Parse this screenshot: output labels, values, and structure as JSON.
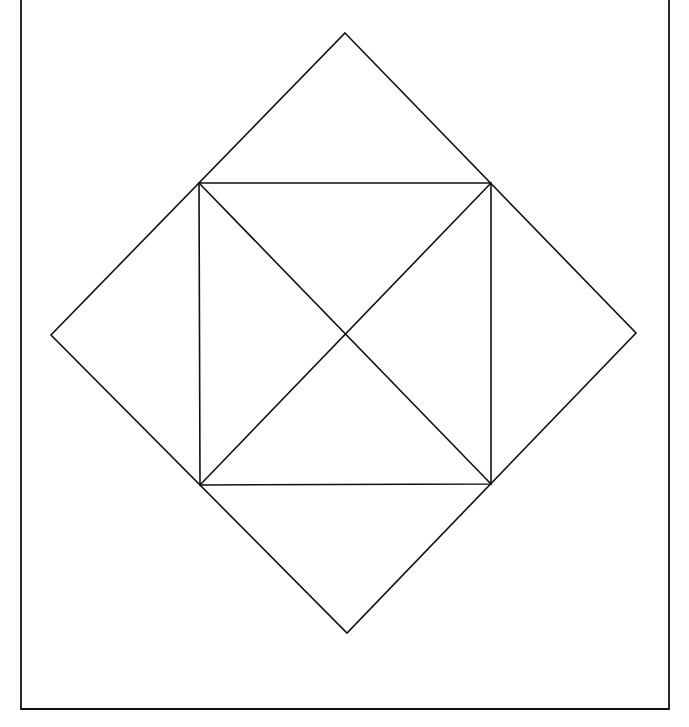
{
  "canvas": {
    "width": 689,
    "height": 727,
    "background": "#ffffff"
  },
  "style": {
    "line_color": "#111111",
    "frame_color": "#111111",
    "line_width": 1.6,
    "frame_width": 1.8
  },
  "frame": {
    "description": "open-top frame (left, bottom, right borders)",
    "left_x": 21,
    "right_x": 669,
    "top_y": 0,
    "bottom_y": 709
  },
  "outer_diamond": {
    "description": "square rotated 45 degrees",
    "vertices": {
      "top": [
        345,
        33
      ],
      "right": [
        636,
        333
      ],
      "bottom": [
        347,
        633
      ],
      "left": [
        51,
        335
      ]
    }
  },
  "inner_square": {
    "description": "axis-aligned square inscribed in the diamond",
    "corners": {
      "top_left": [
        199,
        183
      ],
      "top_right": [
        491,
        183
      ],
      "bottom_right": [
        491,
        484
      ],
      "bottom_left": [
        200,
        485
      ]
    }
  },
  "diagonals": [
    {
      "name": "diagonal-tl-br",
      "from": [
        199,
        183
      ],
      "to": [
        491,
        484
      ]
    },
    {
      "name": "diagonal-tr-bl",
      "from": [
        491,
        183
      ],
      "to": [
        200,
        485
      ]
    }
  ],
  "center": [
    345,
    334
  ]
}
